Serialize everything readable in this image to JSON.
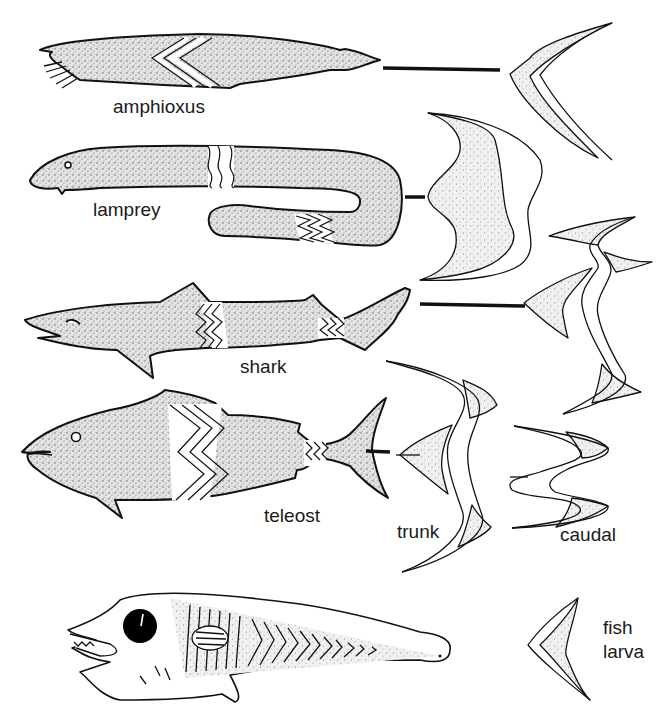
{
  "figure": {
    "rows": [
      {
        "id": "amphioxus",
        "label": "amphioxus",
        "wave_type": "single arc"
      },
      {
        "id": "lamprey",
        "label": "lamprey",
        "wave_type": "full body wave"
      },
      {
        "id": "shark",
        "label": "shark",
        "wave_type": "trunk + caudal"
      },
      {
        "id": "teleost",
        "label": "teleost",
        "wave_type": "trunk + caudal"
      },
      {
        "id": "fish-larva",
        "label": "fish larva",
        "wave_type": "single arc"
      }
    ],
    "wave_labels": {
      "trunk": "trunk",
      "caudal": "caudal"
    },
    "larva_label_line1": "fish",
    "larva_label_line2": "larva"
  },
  "colors": {
    "ink": "#111111",
    "background": "#ffffff",
    "stipple": "#8a8a8a"
  }
}
